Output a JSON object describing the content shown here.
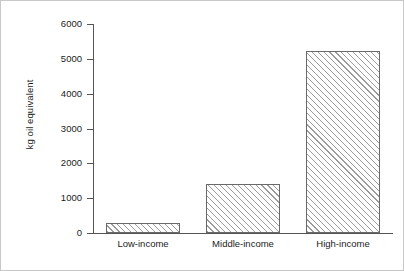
{
  "chart_data": {
    "type": "bar",
    "title": "",
    "subtitle": "",
    "xlabel": "",
    "ylabel": "kg oil equivalent",
    "categories": [
      "Low-income",
      "Middle-income",
      "High-income"
    ],
    "values": [
      290,
      1400,
      5220
    ],
    "ylim": [
      0,
      6000
    ],
    "ytick_values": [
      0,
      1000,
      2000,
      3000,
      4000,
      5000,
      6000
    ],
    "ytick_labels": [
      "0",
      "1000",
      "2000",
      "3000",
      "4000",
      "5000",
      "6000"
    ],
    "grid": false,
    "legend": null,
    "legend_position": "none",
    "bar_fill": "hatched-diagonal",
    "bar_edge_color": "#6a6a6a",
    "hatch_color": "#9a9a9a",
    "axis_color": "#555555",
    "text_color": "#1c1c1c",
    "background_color": "#ffffff",
    "frame_border_color": "#c8c8c8",
    "annotations": []
  }
}
